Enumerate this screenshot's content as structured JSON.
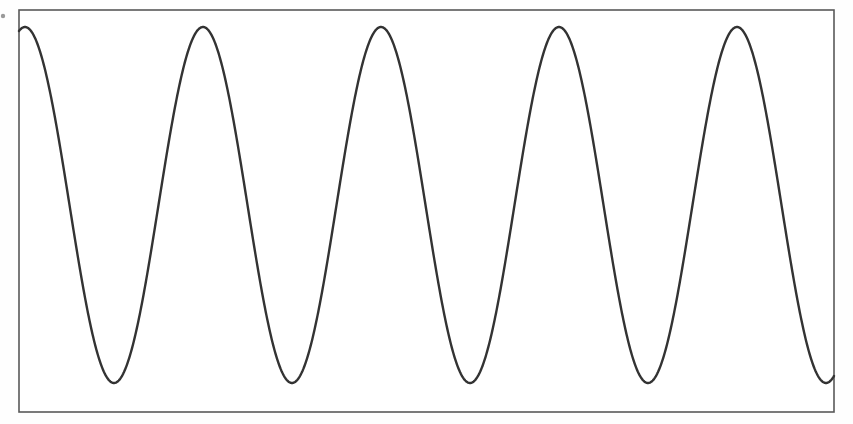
{
  "figure": {
    "title": "",
    "background_color": "#fefefe",
    "width": 853,
    "height": 424
  },
  "axes": {
    "frame": {
      "x": 19,
      "y": 10,
      "width": 815,
      "height": 402,
      "border_color": "#595959",
      "border_width": 1.6,
      "fill_color": "#ffffff"
    },
    "show_ticks": false,
    "show_tick_labels": false,
    "show_grid": false,
    "xlabel": "",
    "ylabel": ""
  },
  "artifacts": {
    "left_margin_speck": {
      "name": "scan-speck",
      "x": 3,
      "y": 16,
      "radius": 2.2,
      "color": "#9a9a9a"
    }
  },
  "chart_data": {
    "type": "line",
    "title": "",
    "subtitle": "",
    "xlabel": "",
    "ylabel": "",
    "legend": [],
    "legend_position": "none",
    "grid": false,
    "series": [
      {
        "name": "sine waveform",
        "color": "#333333",
        "line_width": 2.4,
        "waveform": "sine",
        "amplitude_px": 178,
        "period_px": 178,
        "peak_y_px": 27,
        "trough_y_px": 383,
        "midline_y_px": 205,
        "phase_start_px": 25,
        "x_start_px": 19,
        "x_end_px": 834,
        "cycles_visible": 4.6,
        "peaks_x_px": [
          25,
          200,
          383,
          558,
          737
        ],
        "peaks_y_px": [
          27,
          27,
          27,
          27,
          27
        ],
        "troughs_x_px": [
          108,
          290,
          468,
          648,
          825
        ],
        "troughs_y_px": [
          383,
          383,
          383,
          383,
          383
        ]
      }
    ],
    "xlim": [
      19,
      834
    ],
    "ylim": [
      27,
      383
    ]
  }
}
